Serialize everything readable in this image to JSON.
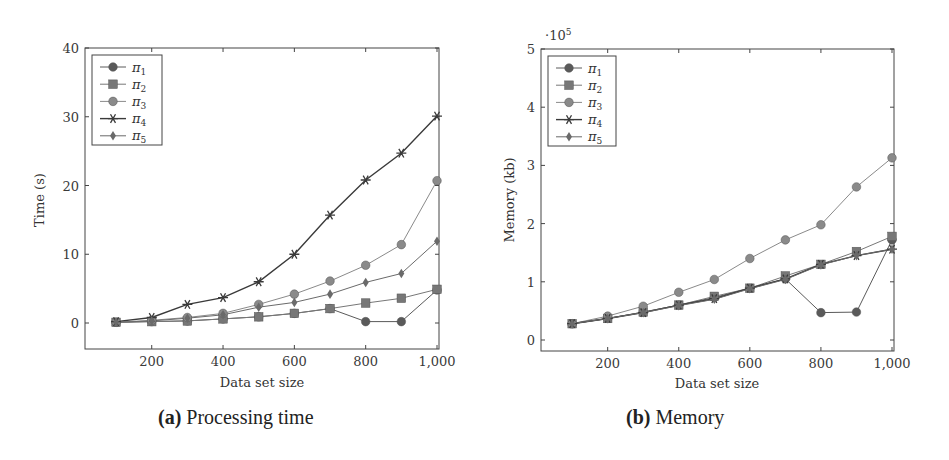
{
  "chart_data": [
    {
      "id": "a",
      "type": "line",
      "caption_tag": "(a)",
      "caption_text": "Processing time",
      "title": "",
      "xlabel": "Data set size",
      "ylabel": "Time (s)",
      "x": [
        100,
        200,
        300,
        400,
        500,
        600,
        700,
        800,
        900,
        1000
      ],
      "xticks": [
        200,
        400,
        600,
        800,
        1000
      ],
      "xtick_labels": [
        "200",
        "400",
        "600",
        "800",
        "1,000"
      ],
      "yticks": [
        0,
        10,
        20,
        30,
        40
      ],
      "ytick_labels": [
        "0",
        "10",
        "20",
        "30",
        "40"
      ],
      "ylim": [
        -4,
        40
      ],
      "xlim": [
        0,
        1000
      ],
      "grid": false,
      "legend_position": "upper left",
      "series": [
        {
          "name": "π1",
          "marker": "circle",
          "color": "#5a5a5a",
          "values": [
            0.1,
            0.2,
            0.3,
            0.6,
            0.9,
            1.4,
            2.1,
            0.2,
            0.2,
            4.8
          ]
        },
        {
          "name": "π2",
          "marker": "square",
          "color": "#777777",
          "values": [
            0.1,
            0.2,
            0.3,
            0.6,
            0.9,
            1.4,
            2.1,
            2.9,
            3.6,
            4.9
          ]
        },
        {
          "name": "π3",
          "marker": "circle",
          "color": "#8a8a8a",
          "values": [
            0.1,
            0.4,
            0.8,
            1.4,
            2.7,
            4.2,
            6.1,
            8.4,
            11.4,
            20.7
          ]
        },
        {
          "name": "π4",
          "marker": "star",
          "color": "#3a3a3a",
          "values": [
            0.2,
            0.8,
            2.7,
            3.7,
            6.0,
            10.0,
            15.7,
            20.8,
            24.7,
            30.1
          ]
        },
        {
          "name": "π5",
          "marker": "diamond",
          "color": "#6a6a6a",
          "values": [
            0.1,
            0.3,
            0.7,
            1.2,
            2.3,
            3.0,
            4.2,
            5.9,
            7.2,
            11.9
          ]
        }
      ]
    },
    {
      "id": "b",
      "type": "line",
      "caption_tag": "(b)",
      "caption_text": "Memory",
      "title": "",
      "xlabel": "Data set size",
      "ylabel": "Memory (kb)",
      "y_scale_note": "·10^5",
      "x": [
        100,
        200,
        300,
        400,
        500,
        600,
        700,
        800,
        900,
        1000
      ],
      "xticks": [
        200,
        400,
        600,
        800,
        1000
      ],
      "xtick_labels": [
        "200",
        "400",
        "600",
        "800",
        "1,000"
      ],
      "yticks": [
        0,
        1,
        2,
        3,
        4,
        5
      ],
      "ytick_labels": [
        "0",
        "1",
        "2",
        "3",
        "4",
        "5"
      ],
      "ylim": [
        -0.2,
        5
      ],
      "xlim": [
        0,
        1000
      ],
      "grid": false,
      "legend_position": "upper left",
      "series": [
        {
          "name": "π1",
          "marker": "circle",
          "color": "#5a5a5a",
          "values": [
            0.28,
            0.37,
            0.48,
            0.6,
            0.73,
            0.89,
            1.05,
            0.47,
            0.48,
            1.72
          ]
        },
        {
          "name": "π2",
          "marker": "square",
          "color": "#777777",
          "values": [
            0.28,
            0.37,
            0.48,
            0.6,
            0.75,
            0.89,
            1.1,
            1.3,
            1.52,
            1.78
          ]
        },
        {
          "name": "π3",
          "marker": "circle",
          "color": "#8a8a8a",
          "values": [
            0.28,
            0.41,
            0.58,
            0.82,
            1.04,
            1.4,
            1.72,
            1.98,
            2.63,
            3.13
          ]
        },
        {
          "name": "π4",
          "marker": "star",
          "color": "#3a3a3a",
          "values": [
            0.28,
            0.37,
            0.47,
            0.6,
            0.71,
            0.89,
            1.05,
            1.3,
            1.45,
            1.56
          ]
        },
        {
          "name": "π5",
          "marker": "diamond",
          "color": "#6a6a6a",
          "values": [
            0.28,
            0.37,
            0.47,
            0.59,
            0.7,
            0.88,
            1.04,
            1.29,
            1.45,
            1.56
          ]
        }
      ]
    }
  ]
}
